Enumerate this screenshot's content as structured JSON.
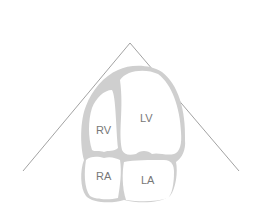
{
  "diagram": {
    "chambers": {
      "rv": "RV",
      "lv": "LV",
      "ra": "RA",
      "la": "LA"
    },
    "colors": {
      "wall": "#cfcfcf",
      "chamber": "#ffffff",
      "sector_line": "#8a8a8a",
      "label": "#777777"
    }
  }
}
